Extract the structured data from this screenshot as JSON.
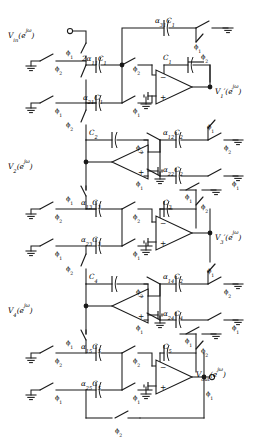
{
  "figure": {
    "type": "switched-capacitor-filter-schematic",
    "stage_count": 5,
    "ink_color": "#1a1a1a",
    "background_color": "#ffffff"
  },
  "nodes": {
    "input": {
      "label": "V",
      "sub": "in",
      "arg": "(e",
      "argexp": "jω",
      "argend": ")",
      "full": "Vin(ejω)"
    },
    "v1": {
      "label": "V",
      "sub": "1",
      "prime": "′",
      "arg": "(e",
      "argexp": "jω",
      "argend": ")",
      "full": "V1′(ejω)"
    },
    "v2": {
      "label": "V",
      "sub": "2",
      "prime": "",
      "arg": "(e",
      "argexp": "jω",
      "argend": ")",
      "full": "V2(ejω)"
    },
    "v3": {
      "label": "V",
      "sub": "3",
      "prime": "′",
      "arg": "(e",
      "argexp": "jω",
      "argend": ")",
      "full": "V3′(ejω)"
    },
    "v4": {
      "label": "V",
      "sub": "4",
      "prime": "",
      "arg": "(e",
      "argexp": "jω",
      "argend": ")",
      "full": "V4(ejω)"
    },
    "output": {
      "label": "V",
      "sub": "out",
      "arg": "(e",
      "argexp": "jω",
      "argend": ")",
      "full": "Vout(ejω)"
    }
  },
  "clock_phases": {
    "phi1": {
      "glyph": "ϕ",
      "sub": "1"
    },
    "phi2": {
      "glyph": "ϕ",
      "sub": "2"
    }
  },
  "capacitors": [
    {
      "id": "c-2a11c1",
      "pre": "2α",
      "presub": "11",
      "main": "C",
      "mainsub": "1",
      "text": "2α11C1",
      "stage": 1
    },
    {
      "id": "c-a21c1",
      "pre": "α",
      "presub": "21",
      "main": "C",
      "mainsub": "1",
      "text": "α21C1",
      "stage": 1
    },
    {
      "id": "c-a31c1",
      "pre": "α",
      "presub": "31",
      "main": "C",
      "mainsub": "1",
      "text": "α31C1",
      "stage": 1
    },
    {
      "id": "c-c1",
      "pre": "",
      "presub": "",
      "main": "C",
      "mainsub": "1",
      "text": "C1",
      "stage": 1
    },
    {
      "id": "c-c2",
      "pre": "",
      "presub": "",
      "main": "C",
      "mainsub": "2",
      "text": "C2",
      "stage": 2
    },
    {
      "id": "c-a12c2",
      "pre": "α",
      "presub": "12",
      "main": "C",
      "mainsub": "2",
      "text": "α12C2",
      "stage": 2
    },
    {
      "id": "c-a22c2",
      "pre": "α",
      "presub": "22",
      "main": "C",
      "mainsub": "2",
      "text": "α22C2",
      "stage": 2
    },
    {
      "id": "c-a13c3",
      "pre": "α",
      "presub": "13",
      "main": "C",
      "mainsub": "3",
      "text": "α13C3",
      "stage": 3
    },
    {
      "id": "c-a23c3",
      "pre": "α",
      "presub": "23",
      "main": "C",
      "mainsub": "3",
      "text": "α23C3",
      "stage": 3
    },
    {
      "id": "c-c3",
      "pre": "",
      "presub": "",
      "main": "C",
      "mainsub": "3",
      "text": "C3",
      "stage": 3
    },
    {
      "id": "c-c4",
      "pre": "",
      "presub": "",
      "main": "C",
      "mainsub": "4",
      "text": "C4",
      "stage": 4
    },
    {
      "id": "c-a14c2",
      "pre": "α",
      "presub": "14",
      "main": "C",
      "mainsub": "2",
      "text": "α14C2",
      "stage": 4
    },
    {
      "id": "c-a24c4",
      "pre": "α",
      "presub": "24",
      "main": "C",
      "mainsub": "4",
      "text": "α24C4",
      "stage": 4
    },
    {
      "id": "c-a15c5",
      "pre": "α",
      "presub": "15",
      "main": "C",
      "mainsub": "5",
      "text": "α15C5",
      "stage": 5
    },
    {
      "id": "c-a25c5",
      "pre": "α",
      "presub": "25",
      "main": "C",
      "mainsub": "5",
      "text": "α25C5",
      "stage": 5
    },
    {
      "id": "c-c5",
      "pre": "",
      "presub": "",
      "main": "C",
      "mainsub": "5",
      "text": "C5",
      "stage": 5
    }
  ],
  "opamps": [
    {
      "id": "opamp-1",
      "orientation": "right",
      "minus": "−",
      "plus": "+",
      "output_node": "v1"
    },
    {
      "id": "opamp-2",
      "orientation": "left",
      "minus": "−",
      "plus": "+",
      "output_node": "v2"
    },
    {
      "id": "opamp-3",
      "orientation": "right",
      "minus": "−",
      "plus": "+",
      "output_node": "v3"
    },
    {
      "id": "opamp-4",
      "orientation": "left",
      "minus": "−",
      "plus": "+",
      "output_node": "v4"
    },
    {
      "id": "opamp-5",
      "orientation": "right",
      "minus": "−",
      "plus": "+",
      "output_node": "output"
    }
  ],
  "switch_labels": [
    "ϕ1",
    "ϕ2",
    "ϕ1",
    "ϕ2",
    "ϕ1",
    "ϕ2",
    "ϕ1",
    "ϕ2",
    "ϕ1",
    "ϕ2",
    "ϕ1",
    "ϕ2",
    "ϕ1",
    "ϕ2",
    "ϕ1",
    "ϕ2"
  ]
}
